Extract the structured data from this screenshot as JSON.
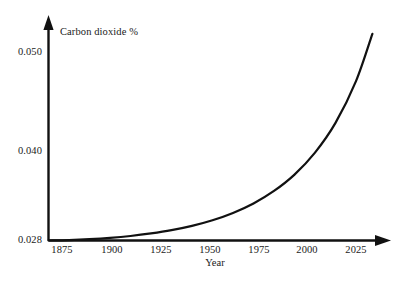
{
  "chart_data": {
    "type": "line",
    "title": "",
    "xlabel": "Year",
    "ylabel": "Carbon dioxide %",
    "xlim": [
      1875,
      2040
    ],
    "ylim": [
      0.028,
      0.0525
    ],
    "grid": false,
    "legend": null,
    "xticks": [
      {
        "label": "1875",
        "value": 1875
      },
      {
        "label": "1900",
        "value": 1900
      },
      {
        "label": "1925",
        "value": 1925
      },
      {
        "label": "1950",
        "value": 1950
      },
      {
        "label": "1975",
        "value": 1975
      },
      {
        "label": "2000",
        "value": 2000
      },
      {
        "label": "2025",
        "value": 2025
      }
    ],
    "yticks": [
      {
        "label": "0.028",
        "value": 0.028
      },
      {
        "label": "0.040",
        "value": 0.04
      },
      {
        "label": "0.050",
        "value": 0.05
      }
    ],
    "series": [
      {
        "name": "Carbon dioxide %",
        "color": "#111111",
        "x": [
          1875,
          1885,
          1895,
          1905,
          1915,
          1925,
          1935,
          1945,
          1955,
          1965,
          1975,
          1985,
          1995,
          2005,
          2015,
          2025,
          2033
        ],
        "values": [
          0.028,
          0.02805,
          0.02815,
          0.0283,
          0.02852,
          0.02882,
          0.0292,
          0.0297,
          0.03035,
          0.0312,
          0.0323,
          0.03375,
          0.03565,
          0.0382,
          0.04165,
          0.0465,
          0.052
        ]
      }
    ]
  },
  "axes": {
    "arrow_color": "#111111",
    "axis_color": "#111111"
  }
}
